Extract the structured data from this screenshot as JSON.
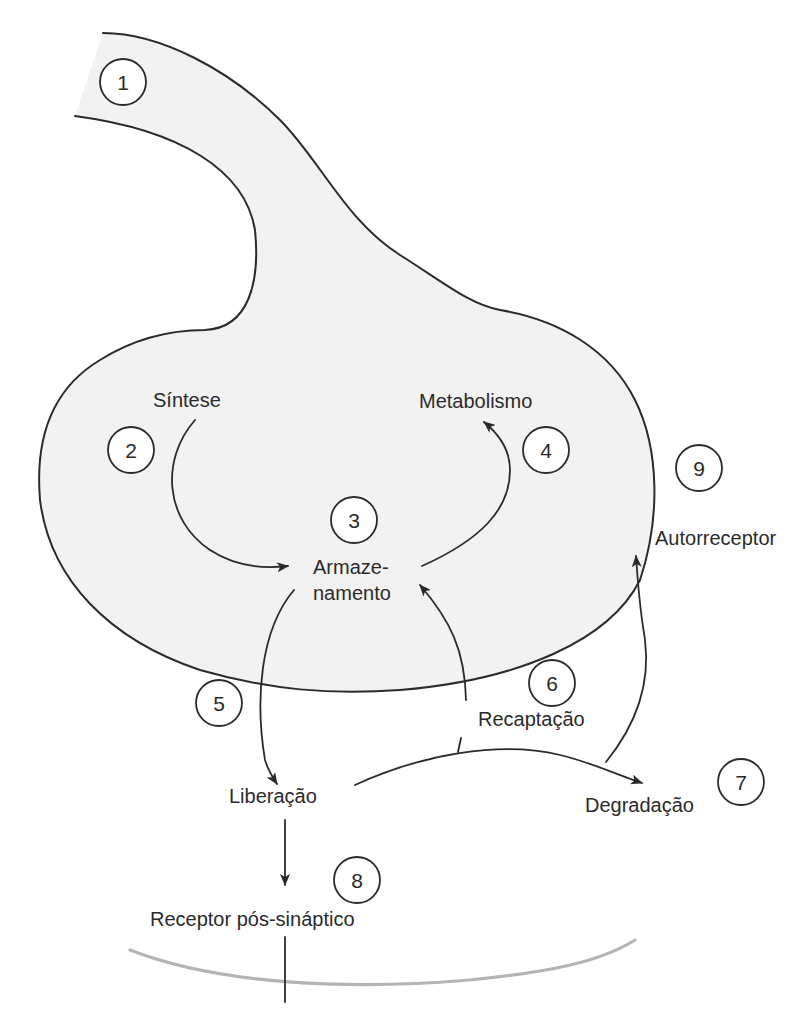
{
  "diagram": {
    "colors": {
      "terminal_fill": "#f2f2f2",
      "line": "#2b2b2b",
      "postsynaptic_membrane": "#b4b4b4",
      "background": "#ffffff"
    },
    "markers": [
      {
        "id": "1",
        "label": "1"
      },
      {
        "id": "2",
        "label": "2"
      },
      {
        "id": "3",
        "label": "3"
      },
      {
        "id": "4",
        "label": "4"
      },
      {
        "id": "5",
        "label": "5"
      },
      {
        "id": "6",
        "label": "6"
      },
      {
        "id": "7",
        "label": "7"
      },
      {
        "id": "8",
        "label": "8"
      },
      {
        "id": "9",
        "label": "9"
      }
    ],
    "labels": {
      "sintese": "Síntese",
      "metabolismo": "Metabolismo",
      "armazenamento_1": "Armaze-",
      "armazenamento_2": "namento",
      "autorreceptor": "Autorreceptor",
      "recaptacao": "Recaptação",
      "liberacao": "Liberação",
      "degradacao": "Degradação",
      "receptor_pos": "Receptor pós-sináptico"
    },
    "flows": [
      {
        "from": "Síntese",
        "to": "Armazenamento",
        "marker": "2"
      },
      {
        "from": "Armazenamento",
        "to": "Metabolismo",
        "marker": "4"
      },
      {
        "from": "Armazenamento",
        "to": "Liberação",
        "marker": "5"
      },
      {
        "from": "Liberação",
        "to": "Recaptação → Armazenamento",
        "marker": "6"
      },
      {
        "from": "Liberação",
        "to": "Degradação",
        "marker": "7"
      },
      {
        "from": "Liberação",
        "to": "Receptor pós-sináptico",
        "marker": "8"
      },
      {
        "from": "Liberação",
        "to": "Autorreceptor",
        "marker": "9"
      }
    ]
  }
}
